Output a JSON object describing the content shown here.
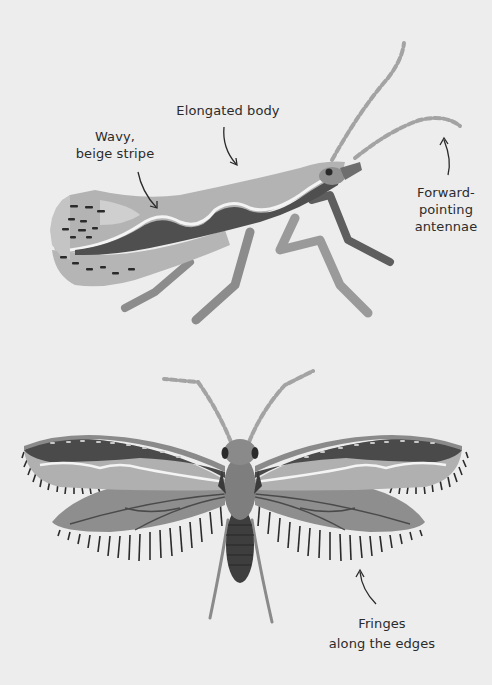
{
  "diagram": {
    "colors": {
      "background": "#ededed",
      "wing_light": "#b8b8b8",
      "wing_mid": "#8e8e8e",
      "wing_dark": "#4a4a4a",
      "stripe": "#f4f4f4",
      "body": "#7a7a7a",
      "fringe": "#2a2a2a",
      "text": "#2b2b2b"
    },
    "side_view": {
      "labels": {
        "elongated_body": "Elongated body",
        "wavy_stripe_line1": "Wavy,",
        "wavy_stripe_line2": "beige stripe",
        "antennae_line1": "Forward-",
        "antennae_line2": "pointing",
        "antennae_line3": "antennae"
      }
    },
    "top_view": {
      "labels": {
        "fringes_line1": "Fringes",
        "fringes_line2": "along the edges"
      }
    }
  }
}
